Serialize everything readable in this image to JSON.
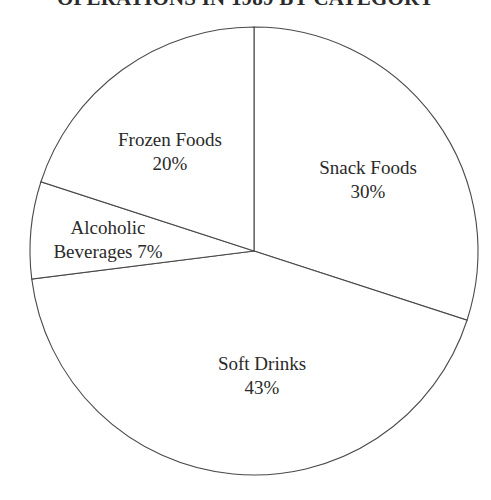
{
  "chart_data": {
    "type": "pie",
    "title": "OPERATIONS IN 1989 BY CATEGORY",
    "xlabel": "",
    "ylabel": "",
    "legend_position": "none",
    "grid": false,
    "units": "percent",
    "total": 100,
    "start_angle_deg": 0,
    "direction": "clockwise",
    "categories": [
      "Snack Foods",
      "Soft Drinks",
      "Alcoholic Beverages",
      "Frozen Foods"
    ],
    "values": [
      30,
      43,
      7,
      20
    ],
    "slices": [
      {
        "label": "Snack Foods",
        "value": 30,
        "value_text": "30%",
        "start_deg": 0,
        "end_deg": 108,
        "color": "#ffffff",
        "stroke": "#4a4a4a"
      },
      {
        "label": "Soft Drinks",
        "value": 43,
        "value_text": "43%",
        "start_deg": 108,
        "end_deg": 262.8,
        "color": "#ffffff",
        "stroke": "#4a4a4a"
      },
      {
        "label": "Alcoholic Beverages",
        "value": 7,
        "value_text": "7%",
        "label_line_1": "Alcoholic",
        "label_line_2_name": "Beverages",
        "start_deg": 262.8,
        "end_deg": 288,
        "color": "#ffffff",
        "stroke": "#4a4a4a"
      },
      {
        "label": "Frozen Foods",
        "value": 20,
        "value_text": "20%",
        "start_deg": 288,
        "end_deg": 360,
        "color": "#ffffff",
        "stroke": "#4a4a4a"
      }
    ]
  },
  "colors": {
    "background": "#ffffff",
    "stroke": "#4a4a4a",
    "text": "#2a2a2a",
    "title_text": "#2b2b2b"
  }
}
